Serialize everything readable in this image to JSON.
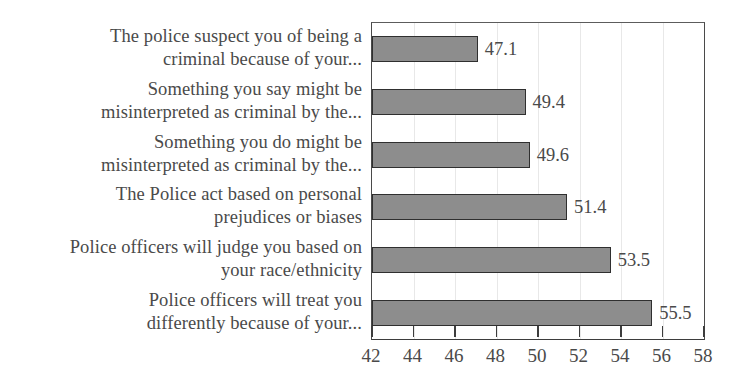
{
  "chart_data": {
    "type": "bar",
    "orientation": "horizontal",
    "title": "",
    "subtitle": "",
    "xlabel": "",
    "ylabel": "",
    "categories": [
      "The police suspect you of being a criminal because of your...",
      "Something you say might be misinterpreted as criminal by the...",
      "Something you do might be misinterpreted as criminal by the...",
      "The Police act based on personal prejudices or biases",
      "Police officers will judge you based on your race/ethnicity",
      "Police officers will treat you differently because of your..."
    ],
    "category_lines": [
      [
        "The police suspect you of being a",
        "criminal because of your..."
      ],
      [
        "Something you say might be",
        "misinterpreted as criminal by the..."
      ],
      [
        "Something you do might be",
        "misinterpreted as criminal by the..."
      ],
      [
        "The Police act based on personal",
        "prejudices or biases"
      ],
      [
        "Police officers will judge you based on",
        "your race/ethnicity"
      ],
      [
        "Police officers will treat you",
        "differently because of your..."
      ]
    ],
    "values": [
      47.1,
      49.4,
      49.6,
      51.4,
      53.5,
      55.5
    ],
    "value_labels": [
      "47.1",
      "49.4",
      "49.6",
      "51.4",
      "53.5",
      "55.5"
    ],
    "xlim": [
      42,
      58
    ],
    "xticks": [
      42,
      44,
      46,
      48,
      50,
      52,
      54,
      56,
      58
    ],
    "xtick_labels": [
      "42",
      "44",
      "46",
      "48",
      "50",
      "52",
      "54",
      "56",
      "58"
    ],
    "grid": true,
    "grid_axis": "x",
    "legend": false,
    "legend_position": "none",
    "bar_fill_color": "#8d8d8d",
    "bar_border_color": "#2f2f2f",
    "text_color": "#4a4a4a",
    "background_color": "#ffffff",
    "gridline_color": "#e8e8e8"
  }
}
